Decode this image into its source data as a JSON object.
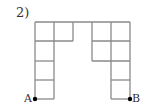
{
  "problem_number": "2)",
  "points": {
    "A": "A",
    "B": "B"
  },
  "grid": {
    "cell_size": 19,
    "line_color": "#8a8a8a",
    "dot_color": "#000000"
  }
}
